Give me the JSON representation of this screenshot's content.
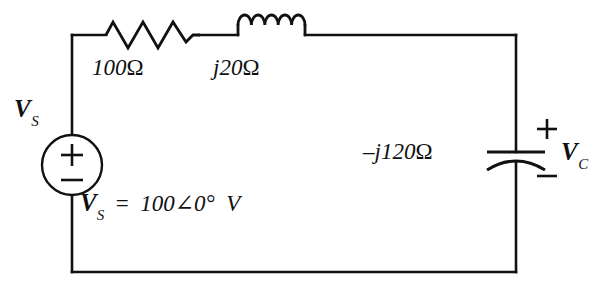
{
  "diagram": {
    "type": "electrical-schematic",
    "background_color": "#ffffff",
    "line_color": "#111111"
  },
  "source": {
    "name": "voltage-source",
    "symbol": "circle-with-plus-minus",
    "label": "V",
    "label_subscript": "S",
    "polarity_top": "+",
    "polarity_bottom": "−"
  },
  "components": {
    "resistor": {
      "name": "resistor",
      "symbol": "zigzag",
      "value": "100",
      "unit": "Ω",
      "label": "100 Ω"
    },
    "inductor": {
      "name": "inductor",
      "symbol": "coil",
      "value": "j20",
      "unit": "Ω",
      "label": "j20 Ω"
    },
    "capacitor": {
      "name": "capacitor",
      "symbol": "curved-plate-capacitor",
      "value": "–j120",
      "unit": "Ω",
      "label": "–j120 Ω",
      "polarity_top": "+",
      "polarity_bottom": "−",
      "voltage_label": "V",
      "voltage_label_subscript": "C"
    }
  },
  "equation": {
    "name": "source-voltage-equation",
    "lhs": "V",
    "lhs_subscript": "S",
    "operator": "=",
    "magnitude": "100",
    "angle_symbol": "∠",
    "phase": "0°",
    "unit": "V",
    "full_text": "V_S  =  100∠0°  V"
  }
}
